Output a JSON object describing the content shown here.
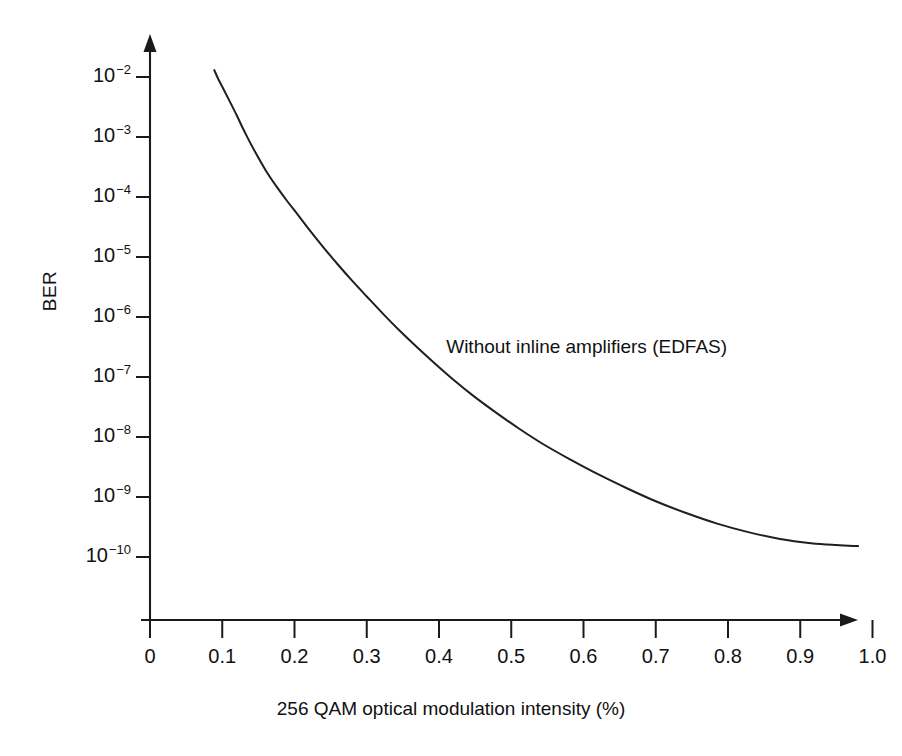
{
  "chart_data": {
    "type": "line",
    "title": "",
    "xlabel": "256 QAM optical modulation intensity (%)",
    "ylabel": "BER",
    "xlim": [
      0,
      1.05
    ],
    "ylim": [
      1e-10,
      0.01
    ],
    "yscale": "log",
    "xscale": "linear",
    "grid": false,
    "legend": null,
    "annotations": [
      {
        "text": "Without inline amplifiers (EDFAS)",
        "x": 0.41,
        "y": 3e-07
      }
    ],
    "xticks": [
      0,
      0.1,
      0.2,
      0.3,
      0.4,
      0.5,
      0.6,
      0.7,
      0.8,
      0.9,
      1.0
    ],
    "xticklabels": [
      "0",
      "0.1",
      "0.2",
      "0.3",
      "0.4",
      "0.5",
      "0.6",
      "0.7",
      "0.8",
      "0.9",
      "1.0"
    ],
    "yticks": [
      0.01,
      0.001,
      0.0001,
      1e-05,
      1e-06,
      1e-07,
      1e-08,
      1e-09,
      1e-10
    ],
    "yticklabels": [
      {
        "base": "10",
        "exponent": "-2"
      },
      {
        "base": "10",
        "exponent": "-3"
      },
      {
        "base": "10",
        "exponent": "-4"
      },
      {
        "base": "10",
        "exponent": "-5"
      },
      {
        "base": "10",
        "exponent": "-6"
      },
      {
        "base": "10",
        "exponent": "-7"
      },
      {
        "base": "10",
        "exponent": "-8"
      },
      {
        "base": "10",
        "exponent": "-9"
      },
      {
        "base": "10",
        "exponent": "-10"
      }
    ],
    "axis_arrows": {
      "x": "right",
      "y": "up"
    },
    "series": [
      {
        "name": "Without inline amplifiers (EDFAS)",
        "color": "#1f1f1f",
        "x": [
          0.089,
          0.095,
          0.102,
          0.11,
          0.12,
          0.132,
          0.146,
          0.16,
          0.175,
          0.19,
          0.205,
          0.222,
          0.24,
          0.26,
          0.28,
          0.3,
          0.322,
          0.345,
          0.37,
          0.395,
          0.42,
          0.448,
          0.478,
          0.51,
          0.545,
          0.582,
          0.62,
          0.66,
          0.7,
          0.742,
          0.785,
          0.828,
          0.872,
          0.915,
          0.95,
          0.98
        ],
        "y": [
          0.013,
          0.009,
          0.0062,
          0.004,
          0.0023,
          0.00115,
          0.00055,
          0.00028,
          0.00015,
          8.5e-05,
          5e-05,
          2.7e-05,
          1.45e-05,
          7.5e-06,
          4e-06,
          2.2e-06,
          1.15e-06,
          6e-07,
          3.1e-07,
          1.65e-07,
          9e-08,
          4.8e-08,
          2.6e-08,
          1.4e-08,
          7.5e-09,
          4.2e-09,
          2.4e-09,
          1.4e-09,
          8.5e-10,
          5.4e-10,
          3.6e-10,
          2.6e-10,
          2e-10,
          1.7e-10,
          1.58e-10,
          1.52e-10
        ]
      }
    ]
  },
  "axis_titles": {
    "x": "256 QAM optical modulation intensity (%)",
    "y": "BER"
  },
  "annotation": {
    "label": "Without inline amplifiers (EDFAS)"
  },
  "colors": {
    "curve": "#1f1f1f",
    "axis": "#1a1a1a",
    "background": "#ffffff",
    "text": "#111111"
  }
}
